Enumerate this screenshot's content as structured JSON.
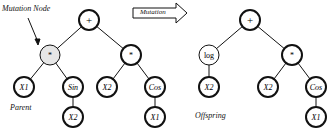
{
  "labels": {
    "mutation_node": "Mutation Node",
    "mutation_arrow": "Mutation",
    "parent": "Parent",
    "offspring": "Offspring"
  },
  "parent_tree": {
    "root": "+",
    "left": "*",
    "left_left": "X1",
    "left_right": "Sin",
    "left_right_child": "X2",
    "right": "*",
    "right_left": "X2",
    "right_right": "Cos",
    "right_right_child": "X1"
  },
  "offspring_tree": {
    "root": "+",
    "left": "log",
    "left_child": "X2",
    "right": "*",
    "right_left": "X2",
    "right_right": "Cos",
    "right_right_child": "X1"
  },
  "colors": {
    "mutation_fill": "#e6e6e6",
    "stroke": "#111111"
  }
}
